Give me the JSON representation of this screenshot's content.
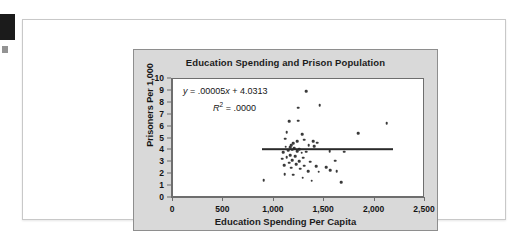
{
  "figure": {
    "bleed_tab": "black-page-tab"
  },
  "chart_data": {
    "type": "scatter",
    "title": "Education Spending and Prison Population",
    "xlabel": "Education Spending Per Capita",
    "ylabel": "Prisoners Per 1,000",
    "xlim": [
      0,
      2500
    ],
    "ylim": [
      0,
      10
    ],
    "xticks": [
      0,
      500,
      1000,
      1500,
      2000,
      2500
    ],
    "xtick_labels": [
      "0",
      "500",
      "1,000",
      "1,500",
      "2,000",
      "2,500"
    ],
    "yticks": [
      0,
      1,
      2,
      3,
      4,
      5,
      6,
      7,
      8,
      9,
      10
    ],
    "ytick_labels": [
      "0",
      "1",
      "2",
      "3",
      "4",
      "5",
      "6",
      "7",
      "8",
      "9",
      "10"
    ],
    "grid": false,
    "legend": "none",
    "annotations": {
      "equation": "y = .00005x + 4.0313",
      "equation_parts": {
        "y": "y",
        "rest": " = .00005",
        "x": "x",
        "tail": " + 4.0313"
      },
      "r_squared": "R2 = .0000",
      "r_squared_parts": {
        "symbol": "R",
        "exponent": "2",
        "value": " = .0000"
      }
    },
    "trendline": {
      "slope": 5e-05,
      "intercept": 4.0313,
      "x_start": 880,
      "x_end": 2180,
      "y_start": 4.08,
      "y_end": 4.14,
      "color": "#2a2a2a"
    },
    "point_color": "#3a3a3a",
    "points": [
      [
        1320,
        8.95
      ],
      [
        1455,
        7.8
      ],
      [
        1245,
        7.6
      ],
      [
        1155,
        6.45
      ],
      [
        1240,
        6.5
      ],
      [
        2120,
        6.3
      ],
      [
        1130,
        5.55
      ],
      [
        1280,
        5.35
      ],
      [
        1840,
        5.45
      ],
      [
        1115,
        5.0
      ],
      [
        1300,
        4.9
      ],
      [
        1390,
        4.75
      ],
      [
        1430,
        4.65
      ],
      [
        1235,
        4.75
      ],
      [
        1195,
        4.6
      ],
      [
        1175,
        4.45
      ],
      [
        1345,
        4.45
      ],
      [
        1400,
        4.35
      ],
      [
        1120,
        4.3
      ],
      [
        1160,
        4.25
      ],
      [
        1205,
        4.2
      ],
      [
        1250,
        4.1
      ],
      [
        1185,
        4.05
      ],
      [
        1145,
        4.0
      ],
      [
        1230,
        3.95
      ],
      [
        1095,
        3.85
      ],
      [
        1275,
        3.8
      ],
      [
        1320,
        3.9
      ],
      [
        1555,
        3.95
      ],
      [
        1700,
        3.9
      ],
      [
        1165,
        3.6
      ],
      [
        1210,
        3.5
      ],
      [
        1130,
        3.45
      ],
      [
        1290,
        3.4
      ],
      [
        1085,
        3.3
      ],
      [
        1185,
        3.2
      ],
      [
        1250,
        3.1
      ],
      [
        1360,
        3.05
      ],
      [
        1610,
        3.15
      ],
      [
        1150,
        2.95
      ],
      [
        1225,
        2.85
      ],
      [
        1105,
        2.75
      ],
      [
        1300,
        2.7
      ],
      [
        1420,
        2.65
      ],
      [
        1520,
        2.6
      ],
      [
        1175,
        2.55
      ],
      [
        1260,
        2.45
      ],
      [
        1560,
        2.35
      ],
      [
        1340,
        2.25
      ],
      [
        1445,
        2.2
      ],
      [
        1110,
        2.0
      ],
      [
        1195,
        1.95
      ],
      [
        1625,
        2.25
      ],
      [
        900,
        1.5
      ],
      [
        1375,
        1.45
      ],
      [
        1670,
        1.35
      ],
      [
        1285,
        1.7
      ]
    ]
  }
}
